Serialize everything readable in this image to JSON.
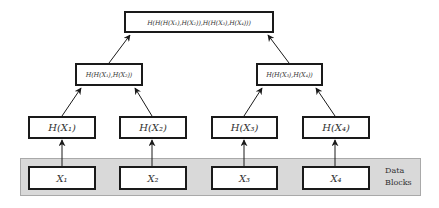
{
  "diagram": {
    "type": "merkle-tree",
    "colors": {
      "band_fill": "#d9d9d9",
      "band_border": "#a9a9a9",
      "node_border": "#1a1a1a",
      "text": "#333333",
      "edge": "#1a1a1a"
    },
    "root": {
      "label": "H(H(H(X₁),H(X₂)),H(H(X₃),H(X₄)))"
    },
    "level1": [
      {
        "label": "H(H(X₁),H(X₂))"
      },
      {
        "label": "H(H(X₃),H(X₄))"
      }
    ],
    "level2": [
      {
        "label": "H(X₁)"
      },
      {
        "label": "H(X₂)"
      },
      {
        "label": "H(X₃)"
      },
      {
        "label": "H(X₄)"
      }
    ],
    "data_blocks": {
      "label_line1": "Data",
      "label_line2": "Blocks",
      "items": [
        {
          "label": "X₁"
        },
        {
          "label": "X₂"
        },
        {
          "label": "X₃"
        },
        {
          "label": "X₄"
        }
      ]
    },
    "edges": [
      {
        "from": "X₁",
        "to": "H(X₁)"
      },
      {
        "from": "X₂",
        "to": "H(X₂)"
      },
      {
        "from": "X₃",
        "to": "H(X₃)"
      },
      {
        "from": "X₄",
        "to": "H(X₄)"
      },
      {
        "from": "H(X₁)",
        "to": "H(H(X₁),H(X₂))"
      },
      {
        "from": "H(X₂)",
        "to": "H(H(X₁),H(X₂))"
      },
      {
        "from": "H(X₃)",
        "to": "H(H(X₃),H(X₄))"
      },
      {
        "from": "H(X₄)",
        "to": "H(H(X₃),H(X₄))"
      },
      {
        "from": "H(H(X₁),H(X₂))",
        "to": "root"
      },
      {
        "from": "H(H(X₃),H(X₄))",
        "to": "root"
      }
    ]
  }
}
